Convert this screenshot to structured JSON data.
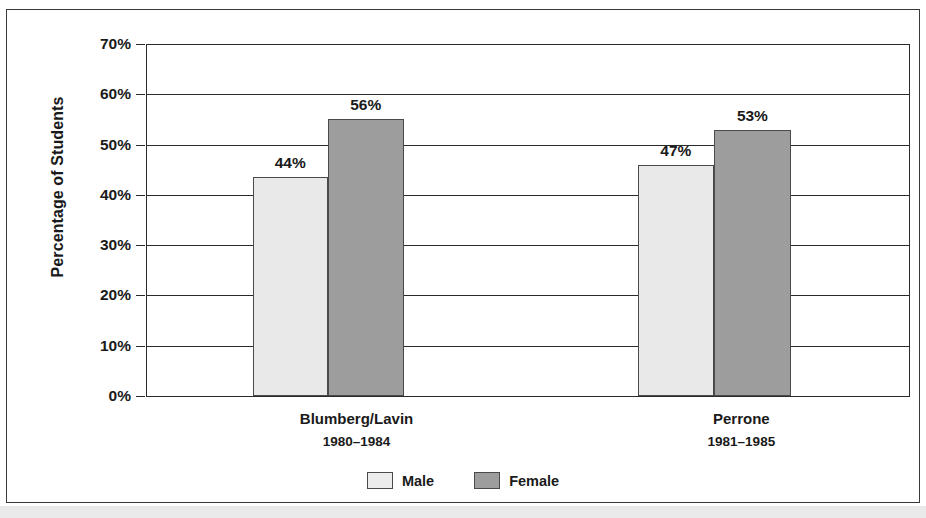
{
  "chart_data": {
    "type": "bar",
    "title": "",
    "xlabel": "",
    "ylabel": "Percentage of Students",
    "ylim": [
      0,
      70
    ],
    "ytick_labels": [
      "70%",
      "60%",
      "50%",
      "40%",
      "30%",
      "20%",
      "10%",
      "0%"
    ],
    "ytick_values": [
      70,
      60,
      50,
      40,
      30,
      20,
      10,
      0
    ],
    "grid": true,
    "legend_position": "bottom",
    "categories": [
      "Blumberg/Lavin",
      "Perrone"
    ],
    "category_periods": [
      "1980–1984",
      "1981–1985"
    ],
    "series": [
      {
        "name": "Male",
        "color": "#e9e9e9",
        "values": [
          44,
          47
        ],
        "plotted_values": [
          43.5,
          46
        ],
        "labels": [
          "44%",
          "47%"
        ]
      },
      {
        "name": "Female",
        "color": "#9d9d9d",
        "values": [
          56,
          53
        ],
        "plotted_values": [
          55,
          53
        ],
        "labels": [
          "56%",
          "53%"
        ]
      }
    ]
  },
  "axis": {
    "y_title": "Percentage of Students",
    "ticks": [
      {
        "label": "70%",
        "value": 70
      },
      {
        "label": "60%",
        "value": 60
      },
      {
        "label": "50%",
        "value": 50
      },
      {
        "label": "40%",
        "value": 40
      },
      {
        "label": "30%",
        "value": 30
      },
      {
        "label": "20%",
        "value": 20
      },
      {
        "label": "10%",
        "value": 10
      },
      {
        "label": "0%",
        "value": 0
      }
    ]
  },
  "groups": [
    {
      "name": "Blumberg/Lavin",
      "period": "1980–1984",
      "center_pct": 27.5,
      "bars": [
        {
          "series": "Male",
          "label": "44%",
          "value": 44,
          "plotted": 43.5,
          "left_pct": 13.9,
          "width_pct": 9.8
        },
        {
          "series": "Female",
          "label": "56%",
          "value": 56,
          "plotted": 55,
          "left_pct": 23.7,
          "width_pct": 10.0
        }
      ]
    },
    {
      "name": "Perrone",
      "period": "1981–1985",
      "center_pct": 78.0,
      "bars": [
        {
          "series": "Male",
          "label": "47%",
          "value": 47,
          "plotted": 46,
          "left_pct": 64.4,
          "width_pct": 10.0
        },
        {
          "series": "Female",
          "label": "53%",
          "value": 53,
          "plotted": 53,
          "left_pct": 74.4,
          "width_pct": 10.1
        }
      ]
    }
  ],
  "legend": {
    "items": [
      {
        "label": "Male",
        "swatch": "male"
      },
      {
        "label": "Female",
        "swatch": "female"
      }
    ]
  }
}
